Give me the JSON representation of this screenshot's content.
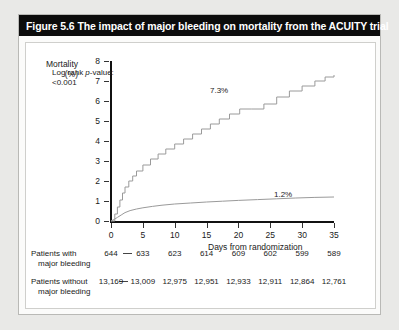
{
  "figure": {
    "title": "Figure 5.6 The impact of major bleeding on mortality from the ACUITY trial"
  },
  "chart_data": {
    "type": "line",
    "title": "The impact of major bleeding on mortality from the ACUITY trial",
    "xlabel": "Days from randomization",
    "ylabel": "Mortality\n(%)",
    "ylabel_line1": "Mortality",
    "ylabel_line2": "(%)",
    "xlim": [
      0,
      35
    ],
    "ylim": [
      0,
      8
    ],
    "xticks": [
      0,
      5,
      10,
      15,
      20,
      25,
      30,
      35
    ],
    "yticks": [
      0,
      1,
      2,
      3,
      4,
      5,
      6,
      7,
      8
    ],
    "grid": false,
    "legend_position": "inline-annotation",
    "annotations": [
      {
        "name": "log-rank",
        "line1": "Log rank ",
        "italic": "p",
        "line1b": "-value:",
        "line2": "<0.001"
      },
      {
        "name": "major-bleeding-endpoint",
        "text": "7.3%"
      },
      {
        "name": "no-major-bleeding-endpoint",
        "text": "1.2%"
      }
    ],
    "series": [
      {
        "name": "Patients with major bleeding",
        "final_value": 7.3,
        "final_label": "7.3%",
        "x": [
          0,
          0.6,
          1.0,
          1.4,
          1.8,
          2.2,
          2.8,
          3.4,
          4.0,
          5.0,
          6.2,
          7.4,
          8.6,
          10.0,
          11.4,
          12.8,
          14.2,
          15.6,
          17.0,
          18.6,
          20.2,
          22.0,
          24.0,
          26.0,
          28.0,
          30.0,
          32.0,
          33.6,
          35.0
        ],
        "y": [
          0,
          0.35,
          0.7,
          1.05,
          1.4,
          1.7,
          2.0,
          2.25,
          2.5,
          2.8,
          3.1,
          3.35,
          3.6,
          3.85,
          4.1,
          4.35,
          4.6,
          4.85,
          5.1,
          5.35,
          5.6,
          5.6,
          5.85,
          6.2,
          6.5,
          6.75,
          7.0,
          7.2,
          7.3
        ]
      },
      {
        "name": "Patients without major bleeding",
        "final_value": 1.2,
        "final_label": "1.2%",
        "x": [
          0,
          0.5,
          1.0,
          1.6,
          2.2,
          3.0,
          4.0,
          5.0,
          6.5,
          8.0,
          10.0,
          12.5,
          15.0,
          17.5,
          20.0,
          23.0,
          26.0,
          29.0,
          32.0,
          35.0
        ],
        "y": [
          0,
          0.08,
          0.18,
          0.3,
          0.42,
          0.52,
          0.6,
          0.66,
          0.73,
          0.79,
          0.85,
          0.9,
          0.95,
          0.99,
          1.03,
          1.07,
          1.11,
          1.15,
          1.18,
          1.2
        ]
      }
    ],
    "risk_table": {
      "columns": [
        0,
        5,
        10,
        15,
        20,
        25,
        30,
        35
      ],
      "rows": [
        {
          "label_line1": "Patients with",
          "label_line2": "major bleeding",
          "marker": "dash",
          "values": [
            "644",
            "633",
            "623",
            "614",
            "609",
            "602",
            "599",
            "589"
          ]
        },
        {
          "label_line1": "Patients without",
          "label_line2": "major bleeding",
          "marker": "dash",
          "values": [
            "13,169",
            "13,009",
            "12,975",
            "12,951",
            "12,933",
            "12,911",
            "12,864",
            "12,761"
          ]
        }
      ]
    }
  }
}
